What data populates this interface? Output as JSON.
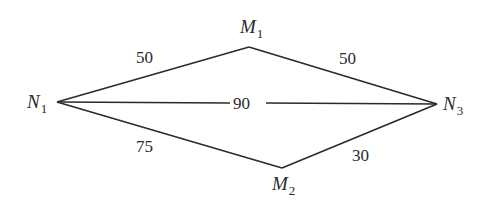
{
  "diagram": {
    "type": "weighted-graph",
    "nodes": [
      {
        "id": "N1",
        "letter": "N",
        "sub": "1",
        "x": 57,
        "y": 102
      },
      {
        "id": "M1",
        "letter": "M",
        "sub": "1",
        "x": 249,
        "y": 47
      },
      {
        "id": "N3",
        "letter": "N",
        "sub": "3",
        "x": 437,
        "y": 104
      },
      {
        "id": "M2",
        "letter": "M",
        "sub": "2",
        "x": 282,
        "y": 168
      }
    ],
    "edges": [
      {
        "from": "N1",
        "to": "M1",
        "weight": "50"
      },
      {
        "from": "M1",
        "to": "N3",
        "weight": "50"
      },
      {
        "from": "N1",
        "to": "N3",
        "weight": "90"
      },
      {
        "from": "N1",
        "to": "M2",
        "weight": "75"
      },
      {
        "from": "M2",
        "to": "N3",
        "weight": "30"
      }
    ]
  }
}
